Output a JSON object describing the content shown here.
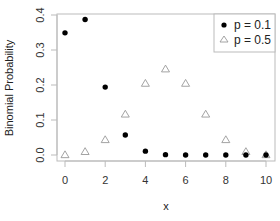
{
  "chart_data": {
    "type": "scatter",
    "title": "",
    "xlabel": "x",
    "ylabel": "Binomial Probability",
    "xlim": [
      -0.4,
      10.4
    ],
    "ylim": [
      0,
      0.4
    ],
    "x_ticks": [
      0,
      2,
      4,
      6,
      8,
      10
    ],
    "y_ticks": [
      "0.0",
      "0.1",
      "0.2",
      "0.3",
      "0.4"
    ],
    "grid": false,
    "legend_position": "top-right",
    "x": [
      0,
      1,
      2,
      3,
      4,
      5,
      6,
      7,
      8,
      9,
      10
    ],
    "series": [
      {
        "name": "p = 0.1",
        "marker": "filled-circle",
        "color": "#000000",
        "values": [
          0.349,
          0.387,
          0.194,
          0.057,
          0.011,
          0.001,
          0.0,
          0.0,
          0.0,
          0.0,
          0.0
        ]
      },
      {
        "name": "p = 0.5",
        "marker": "open-triangle",
        "color": "#999999",
        "values": [
          0.001,
          0.01,
          0.044,
          0.117,
          0.205,
          0.246,
          0.205,
          0.117,
          0.044,
          0.01,
          0.001
        ]
      }
    ]
  },
  "legend": {
    "items": [
      {
        "label": "p = 0.1"
      },
      {
        "label": "p = 0.5"
      }
    ]
  },
  "axes": {
    "xlabel": "x",
    "ylabel": "Binomial Probability",
    "x_tick_labels": [
      "0",
      "2",
      "4",
      "6",
      "8",
      "10"
    ],
    "y_tick_labels": [
      "0.0",
      "0.1",
      "0.2",
      "0.3",
      "0.4"
    ]
  }
}
